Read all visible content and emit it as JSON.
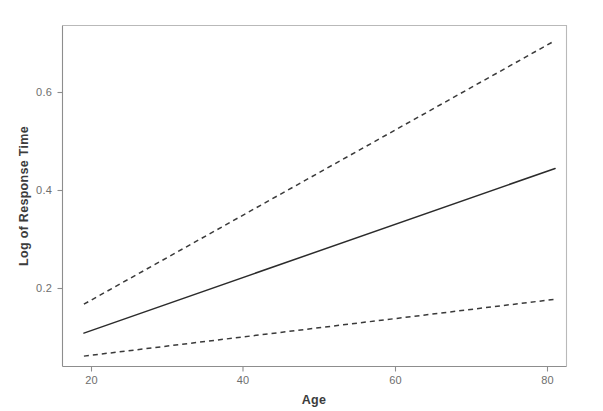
{
  "chart_data": {
    "type": "line",
    "title": "",
    "xlabel": "Age",
    "ylabel": "Log of Response Time",
    "xlim": [
      17.2,
      83.0
    ],
    "ylim": [
      0.028,
      0.735
    ],
    "xticks": [
      20,
      40,
      60,
      80
    ],
    "xtick_labels": [
      "20",
      "40",
      "60",
      "80"
    ],
    "yticks": [
      0.2,
      0.4,
      0.6
    ],
    "ytick_labels": [
      "0.2",
      "0.4",
      "0.6"
    ],
    "grid": false,
    "legend": "none",
    "x": [
      19.0,
      81.0
    ],
    "series": [
      {
        "name": "Upper confidence limit",
        "style": "dashed",
        "color": "#3a3a3a",
        "values": [
          0.168,
          0.706
        ]
      },
      {
        "name": "Fitted regression line",
        "style": "solid",
        "color": "#2b2b2b",
        "values": [
          0.109,
          0.445
        ]
      },
      {
        "name": "Lower confidence limit",
        "style": "dashed",
        "color": "#3a3a3a",
        "values": [
          0.062,
          0.178
        ]
      }
    ]
  },
  "axes": {
    "x_axis_name": "Age",
    "y_axis_name": "Log of Response Time"
  }
}
